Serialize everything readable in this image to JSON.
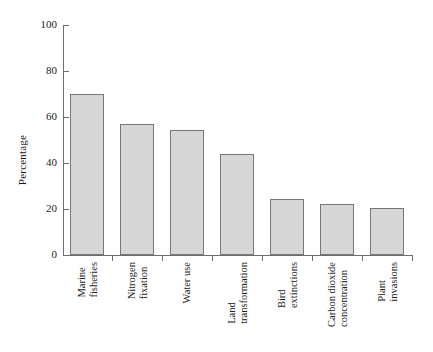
{
  "chart_data": {
    "type": "bar",
    "title": "",
    "xlabel": "",
    "ylabel": "Percentage",
    "ylim": [
      0,
      100
    ],
    "yticks": [
      0,
      20,
      40,
      60,
      80,
      100
    ],
    "ytick_labels": [
      "0",
      "20",
      "40",
      "60",
      "80",
      "100"
    ],
    "grid": false,
    "legend": null,
    "categories": [
      "Marine fisheries",
      "Nitrogen fixation",
      "Water use",
      "Land transformation",
      "Bird extinctions",
      "Carbon dioxide concentration",
      "Plant invasions"
    ],
    "category_lines": [
      [
        "Marine",
        "fisheries"
      ],
      [
        "Nitrogen",
        "fixation"
      ],
      [
        "Water use"
      ],
      [
        "Land",
        "transformation"
      ],
      [
        "Bird",
        "extinctions"
      ],
      [
        "Carbon dioxide",
        "concentration"
      ],
      [
        "Plant",
        "invasions"
      ]
    ],
    "values": [
      70,
      57,
      54.5,
      44,
      24.5,
      22,
      20.5
    ],
    "value_labels": [
      "70",
      "57",
      "54.5",
      "44",
      "24.5",
      "22",
      "20.5"
    ],
    "colors": {
      "bar_fill": "#d7d7d7",
      "bar_border": "#777777",
      "axis": "#6e6e6e",
      "text": "#1a1a1a",
      "background": "#ffffff"
    }
  }
}
